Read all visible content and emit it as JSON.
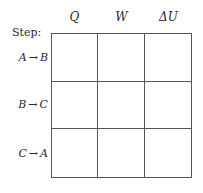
{
  "table": {
    "step_label": "Step:",
    "columns": [
      {
        "label": "Q"
      },
      {
        "label": "W"
      },
      {
        "label": "ΔU"
      }
    ],
    "rows": [
      {
        "from": "A",
        "arrow": "→",
        "to": "B",
        "cells": [
          "",
          "",
          ""
        ]
      },
      {
        "from": "B",
        "arrow": "→",
        "to": "C",
        "cells": [
          "",
          "",
          ""
        ]
      },
      {
        "from": "C",
        "arrow": "→",
        "to": "A",
        "cells": [
          "",
          "",
          ""
        ]
      }
    ]
  }
}
